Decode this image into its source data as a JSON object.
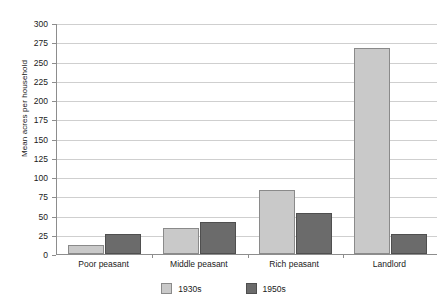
{
  "chart_data": {
    "type": "bar",
    "title": "",
    "xlabel": "",
    "ylabel": "Mean acres per household",
    "categories": [
      "Poor peasant",
      "Middle peasant",
      "Rich peasant",
      "Landlord"
    ],
    "series": [
      {
        "name": "1930s",
        "color": "#c9c9c9",
        "values": [
          12,
          34,
          83,
          268
        ]
      },
      {
        "name": "1950s",
        "color": "#6b6b6b",
        "values": [
          26,
          41,
          53,
          26
        ]
      }
    ],
    "ylim": [
      0,
      300
    ],
    "yticks": [
      0,
      25,
      50,
      75,
      100,
      125,
      150,
      175,
      200,
      225,
      250,
      275,
      300
    ],
    "ytick_labels": [
      "0",
      "25",
      "50",
      "75",
      "100",
      "125",
      "150",
      "175",
      "200",
      "225",
      "250",
      "275",
      "300"
    ],
    "grid": true,
    "legend_position": "bottom"
  }
}
